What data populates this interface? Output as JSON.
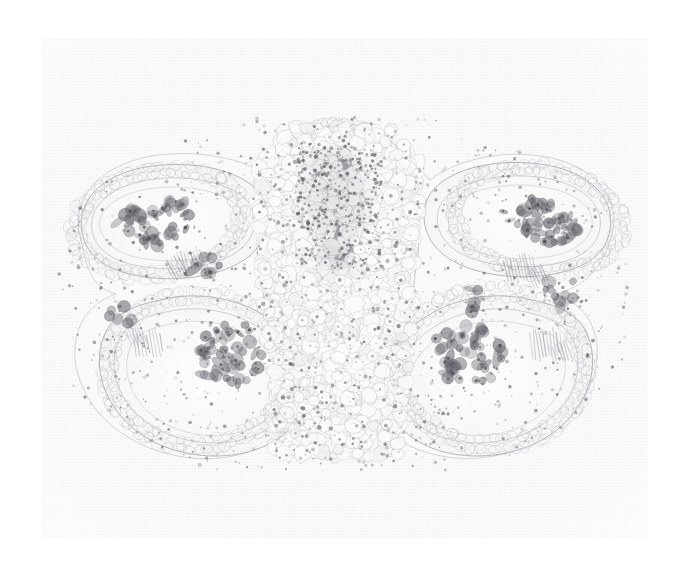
{
  "image": {
    "kind": "photomicrograph",
    "subject": "plant anther transverse section",
    "technique": "light microscopy, stained histological section",
    "background_color": "#ffffff",
    "slide_color": "#fbfbfa",
    "tissue_wall_color": "#9a9aa0",
    "pollen_color": "#6d6d73",
    "vascular_color": "#74747b",
    "width": 681,
    "height": 579,
    "caption": "",
    "labels": []
  },
  "specimen": {
    "outline_color": "#a9a9af",
    "connective": {
      "name": "connective parenchyma",
      "fill": "#f7f7f6",
      "cell_wall": "#adadb3"
    },
    "vascular_bundle": {
      "name": "central vascular bundle",
      "center_x": 336,
      "center_y": 205,
      "radius_x": 38,
      "radius_y": 52,
      "fill": "#8d8d95"
    },
    "locules": [
      {
        "id": "upper-left",
        "label": "pollen sac 1",
        "cx": 158,
        "cy": 227,
        "rx": 88,
        "ry": 45,
        "rot": -12,
        "pollen_count": 46
      },
      {
        "id": "upper-right",
        "label": "pollen sac 2",
        "cx": 545,
        "cy": 225,
        "rx": 88,
        "ry": 45,
        "rot": 10,
        "pollen_count": 48
      },
      {
        "id": "lower-left",
        "label": "pollen sac 3",
        "cx": 234,
        "cy": 358,
        "rx": 74,
        "ry": 66,
        "rot": 0,
        "pollen_count": 44
      },
      {
        "id": "lower-right",
        "label": "pollen sac 4",
        "cx": 472,
        "cy": 357,
        "rx": 76,
        "ry": 68,
        "rot": 0,
        "pollen_count": 50
      }
    ],
    "central_groove": {
      "name": "median longitudinal groove",
      "x": 341,
      "top_y": 248,
      "bottom_y": 452,
      "width": 16
    }
  }
}
